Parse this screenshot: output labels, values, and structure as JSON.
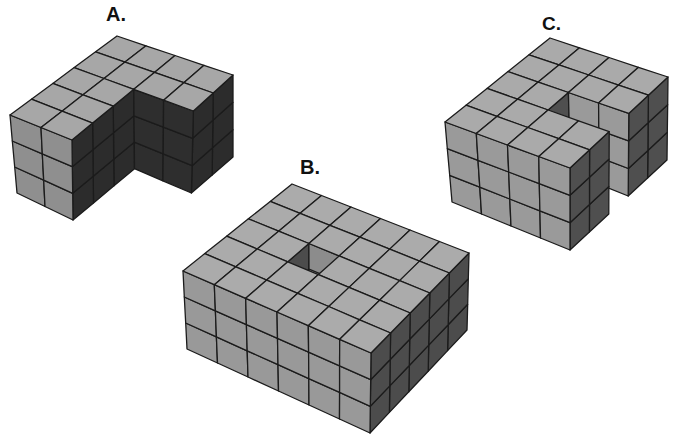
{
  "labels": {
    "a": "A.",
    "b": "B.",
    "c": "C."
  },
  "colors": {
    "background": "#ffffff",
    "edge": "#1b1b1b"
  },
  "figures": [
    {
      "id": "a",
      "label": "A.",
      "description": "L-shaped block: 4 x 5 footprint, 3 cubes high, 2 x 3 corner notch removed (full height)",
      "grid": {
        "u": 4,
        "v": 5,
        "z": 3
      },
      "cube_count": 42,
      "removed": [
        {
          "u": [
            2,
            4
          ],
          "v": [
            2,
            5
          ],
          "z": [
            0,
            3
          ]
        }
      ],
      "colors": {
        "top": "#a7a7a7",
        "front": "#8f8f8f",
        "right": "#2c2c2c",
        "inner_front": "#2e2e2e"
      },
      "inner_front_dark": true,
      "projection": {
        "top": {
          "back": [
            117,
            36
          ],
          "right": [
            233,
            75
          ],
          "left": [
            10,
            115
          ],
          "front": [
            134,
            165
          ]
        },
        "bottom": {
          "back": [
            118,
            112
          ],
          "right": [
            233,
            157
          ],
          "left": [
            17,
            193
          ],
          "front": [
            129,
            247
          ]
        }
      }
    },
    {
      "id": "b",
      "label": "B.",
      "description": "Rectangular block: 6 x 5 footprint, 3 cubes high, single-cube shaft removed near the center",
      "grid": {
        "u": 6,
        "v": 5,
        "z": 3
      },
      "cube_count": 87,
      "removed": [
        {
          "u": [
            2,
            3
          ],
          "v": [
            2,
            3
          ],
          "z": [
            0,
            3
          ]
        }
      ],
      "colors": {
        "top": "#ababab",
        "front": "#999999",
        "right": "#4c4c4c",
        "inner_front": "#8c8c8c"
      },
      "inner_front_dark": false,
      "projection": {
        "top": {
          "back": [
            292,
            184
          ],
          "right": [
            469,
            253
          ],
          "left": [
            183,
            271
          ],
          "front": [
            371,
            353
          ]
        },
        "bottom": {
          "back": [
            292,
            258
          ],
          "right": [
            467,
            330
          ],
          "left": [
            187,
            349
          ],
          "front": [
            370,
            433
          ]
        }
      }
    },
    {
      "id": "c",
      "label": "C.",
      "description": "C-shaped block: 4 x 5 footprint, 3 cubes high, 2 x 1 slot removed on the right side (full height)",
      "grid": {
        "u": 4,
        "v": 5,
        "z": 3
      },
      "cube_count": 54,
      "removed": [
        {
          "u": [
            2,
            4
          ],
          "v": [
            2,
            3
          ],
          "z": [
            0,
            3
          ]
        }
      ],
      "colors": {
        "top": "#aaaaaa",
        "front": "#9a9a9a",
        "right": "#4f4f4f",
        "inner_front": "#9a9a9a"
      },
      "inner_front_dark": false,
      "projection": {
        "top": {
          "back": [
            550,
            38
          ],
          "right": [
            668,
            77
          ],
          "left": [
            445,
            122
          ],
          "front": [
            570,
            168
          ]
        },
        "bottom": {
          "back": [
            553,
            115
          ],
          "right": [
            667,
            160
          ],
          "left": [
            452,
            202
          ],
          "front": [
            570,
            250
          ]
        }
      }
    }
  ]
}
